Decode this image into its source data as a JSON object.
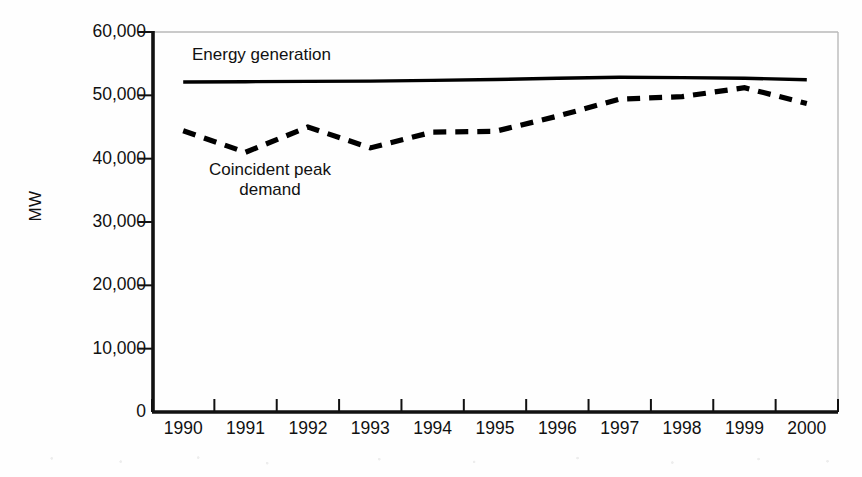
{
  "chart_data": {
    "type": "line",
    "title": "",
    "xlabel": "",
    "ylabel": "MW",
    "x": [
      1990,
      1991,
      1992,
      1993,
      1994,
      1995,
      1996,
      1997,
      1998,
      1999,
      2000
    ],
    "xtick_labels": [
      "1990",
      "1991",
      "1992",
      "1993",
      "1994",
      "1995",
      "1996",
      "1997",
      "1998",
      "1999",
      "2000"
    ],
    "ytick_labels": [
      "60,000",
      "50,000",
      "40,000",
      "30,000",
      "20,000",
      "10,000",
      "0"
    ],
    "ytick_values": [
      60000,
      50000,
      40000,
      30000,
      20000,
      10000,
      0
    ],
    "ylim": [
      0,
      60000
    ],
    "grid": false,
    "legend_position": "in-plot-annotations",
    "series": [
      {
        "name": "Energy generation",
        "style": "solid",
        "color": "#000000",
        "values": [
          52100,
          52150,
          52200,
          52250,
          52350,
          52500,
          52700,
          52850,
          52800,
          52700,
          52450
        ]
      },
      {
        "name": "Coincident peak demand",
        "style": "dashed",
        "color": "#000000",
        "values": [
          44400,
          41000,
          45000,
          41700,
          44200,
          44300,
          46700,
          49400,
          49800,
          51200,
          48700
        ]
      }
    ]
  },
  "annotations": {
    "energy_generation": "Energy generation",
    "coincident_peak_line1": "Coincident peak",
    "coincident_peak_line2": "demand"
  },
  "axes": {
    "y_label": "MW"
  }
}
